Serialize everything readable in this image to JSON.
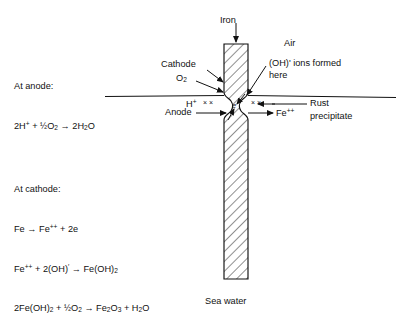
{
  "figure": {
    "type": "electrochemical-corrosion-diagram"
  },
  "labels": {
    "iron": "Iron",
    "air": "Air",
    "sea_water": "Sea water",
    "cathode": "Cathode",
    "oxygen": "O₂",
    "anode": "Anode",
    "hydrogen_ion": "H⁺",
    "ferrous_ion": "Fe⁺⁺",
    "electron": "e",
    "oh_ions_line1": "(OH)' ions formed",
    "oh_ions_line2": "here",
    "rust_line1": "Rust",
    "rust_line2": "precipitate",
    "electron_marks_left": "× ×",
    "electron_marks_right": "× ×"
  },
  "anode_block": {
    "heading": "At anode:",
    "equations": [
      "2H⁺ + ½O₂ → 2H₂O"
    ]
  },
  "cathode_block": {
    "heading": "At cathode:",
    "equations": [
      "Fe → Fe⁺⁺ + 2e",
      "Fe⁺⁺ + 2(OH)' → Fe(OH)₂",
      "2Fe(OH)₂ + ½O₂ → Fe₂O₃ + H₂O"
    ]
  },
  "colors": {
    "ink": "#111111",
    "background": "#ffffff",
    "hatch": "#222222"
  }
}
